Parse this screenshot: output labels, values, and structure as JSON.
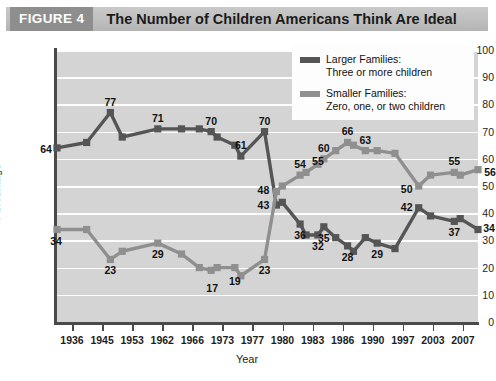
{
  "figure": {
    "badge": "FIGURE 4",
    "title": "The Number of Children Americans Think Are Ideal"
  },
  "colors": {
    "larger": "#555555",
    "smaller": "#8f8f8f",
    "plot_background": "#d4d4d4",
    "gridline": "#fdfdfd",
    "axis": "#4a4a4a",
    "badge_background": "#8e8e8e",
    "title_bar": "#bfbfbf"
  },
  "legend": {
    "position": "top-right",
    "items": [
      {
        "name": "larger-families",
        "line1": "Larger Families:",
        "line2": "Three or more children",
        "color": "#555555"
      },
      {
        "name": "smaller-families",
        "line1": "Smaller Families:",
        "line2": "Zero, one, or two children",
        "color": "#8f8f8f"
      }
    ]
  },
  "chart_data": {
    "type": "line",
    "title": "The Number of Children Americans Think Are Ideal",
    "xlabel": "Year",
    "ylabel": "Percentage",
    "ylim": [
      0,
      100
    ],
    "yticks": [
      0,
      10,
      20,
      30,
      40,
      50,
      60,
      70,
      80,
      90,
      100
    ],
    "grid": "horizontal",
    "xticks": [
      "1936",
      "1945",
      "1953",
      "1962",
      "1966",
      "1973",
      "1977",
      "1980",
      "1983",
      "1986",
      "1990",
      "1997",
      "2003",
      "2007"
    ],
    "x": [
      1936,
      1941,
      1945,
      1947,
      1953,
      1957,
      1960,
      1962,
      1963,
      1966,
      1967,
      1971,
      1973,
      1974,
      1977,
      1978,
      1980,
      1981,
      1983,
      1985,
      1986,
      1988,
      1990,
      1993,
      1997,
      1999,
      2003,
      2004,
      2007
    ],
    "series": [
      {
        "name": "Larger Families: Three or more children",
        "color": "#555555",
        "values": [
          64,
          66,
          77,
          68,
          71,
          71,
          71,
          70,
          68,
          65,
          61,
          70,
          43,
          44,
          36,
          32,
          32,
          35,
          31,
          28,
          26,
          31,
          29,
          27,
          42,
          39,
          37,
          38,
          34
        ],
        "labeled_points": [
          {
            "x": 1936,
            "value": 64
          },
          {
            "x": 1945,
            "value": 77
          },
          {
            "x": 1953,
            "value": 71
          },
          {
            "x": 1962,
            "value": 70
          },
          {
            "x": 1967,
            "value": 61
          },
          {
            "x": 1971,
            "value": 70
          },
          {
            "x": 1973,
            "value": 43
          },
          {
            "x": 1977,
            "value": 36
          },
          {
            "x": 1980,
            "value": 32
          },
          {
            "x": 1981,
            "value": 35
          },
          {
            "x": 1985,
            "value": 28
          },
          {
            "x": 1990,
            "value": 29
          },
          {
            "x": 1997,
            "value": 42
          },
          {
            "x": 2003,
            "value": 37
          },
          {
            "x": 2007,
            "value": 34
          }
        ]
      },
      {
        "name": "Smaller Families: Zero, one, or two children",
        "color": "#8f8f8f",
        "values": [
          34,
          34,
          23,
          26,
          29,
          25,
          20,
          19,
          20,
          20,
          17,
          23,
          48,
          50,
          54,
          55,
          58,
          60,
          63,
          66,
          65,
          63,
          63,
          62,
          50,
          54,
          55,
          54,
          56
        ],
        "labeled_points": [
          {
            "x": 1936,
            "value": 34
          },
          {
            "x": 1945,
            "value": 23
          },
          {
            "x": 1953,
            "value": 29
          },
          {
            "x": 1962,
            "value": 17
          },
          {
            "x": 1966,
            "value": 19
          },
          {
            "x": 1971,
            "value": 23
          },
          {
            "x": 1973,
            "value": 48
          },
          {
            "x": 1977,
            "value": 54
          },
          {
            "x": 1980,
            "value": 55
          },
          {
            "x": 1981,
            "value": 60
          },
          {
            "x": 1985,
            "value": 66
          },
          {
            "x": 1988,
            "value": 63
          },
          {
            "x": 1997,
            "value": 50
          },
          {
            "x": 2003,
            "value": 55
          },
          {
            "x": 2007,
            "value": 56
          }
        ]
      }
    ]
  }
}
